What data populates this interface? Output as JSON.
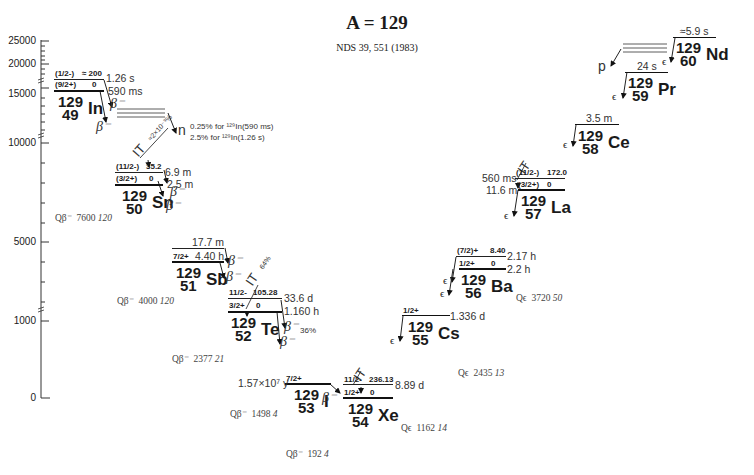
{
  "title": "A = 129",
  "reference": "NDS 39,  551  (1983)",
  "axis": {
    "ticks": [
      "25000",
      "20000",
      "15000",
      "10000",
      "5000",
      "1000",
      "0"
    ]
  },
  "nuclides": {
    "In": {
      "A": "129",
      "Z": "49",
      "sym": "In",
      "levels": [
        {
          "jp": "(1/2-)",
          "energy": "≈ 200",
          "halflife": "1.26 s"
        },
        {
          "jp": "(9/2+)",
          "energy": "0",
          "halflife": "590 ms"
        }
      ],
      "decays": [
        "β⁻",
        "β⁻"
      ]
    },
    "Sn": {
      "A": "129",
      "Z": "50",
      "sym": "Sn",
      "levels": [
        {
          "jp": "(11/2-)",
          "energy": "35.2",
          "halflife": "6.9 m"
        },
        {
          "jp": "(3/2+)",
          "energy": "0",
          "halflife": "2.5 m"
        }
      ],
      "decays": [
        "β⁻",
        "β⁻"
      ]
    },
    "Sb": {
      "A": "129",
      "Z": "51",
      "sym": "Sb",
      "levels": [
        {
          "jp": "",
          "energy": "",
          "halflife": "17.7 m"
        },
        {
          "jp": "7/2+",
          "energy": "",
          "halflife": "4.40 h"
        }
      ],
      "decays": [
        "β⁻",
        "β⁻"
      ]
    },
    "Te": {
      "A": "129",
      "Z": "52",
      "sym": "Te",
      "levels": [
        {
          "jp": "11/2-",
          "energy": "105.28",
          "halflife": "33.6 d"
        },
        {
          "jp": "3/2+",
          "energy": "0",
          "halflife": "1.160 h"
        }
      ],
      "decays": [
        "β⁻",
        "β⁻"
      ],
      "branch": "36%"
    },
    "I": {
      "A": "129",
      "Z": "53",
      "sym": "I",
      "levels": [
        {
          "jp": "7/2+",
          "energy": "",
          "halflife": "1.57×10⁷ y"
        }
      ],
      "decays": [
        "β⁻"
      ]
    },
    "Xe": {
      "A": "129",
      "Z": "54",
      "sym": "Xe",
      "levels": [
        {
          "jp": "11/2-",
          "energy": "236.13",
          "halflife": "8.89 d"
        },
        {
          "jp": "1/2+",
          "energy": "0",
          "halflife": ""
        }
      ]
    },
    "Cs": {
      "A": "129",
      "Z": "55",
      "sym": "Cs",
      "levels": [
        {
          "jp": "1/2+",
          "energy": "",
          "halflife": "1.336 d"
        }
      ],
      "decays": [
        "ϵ"
      ]
    },
    "Ba": {
      "A": "129",
      "Z": "56",
      "sym": "Ba",
      "levels": [
        {
          "jp": "(7/2)+",
          "energy": "8.40",
          "halflife": "2.17 h"
        },
        {
          "jp": "1/2+",
          "energy": "0",
          "halflife": "2.2 h"
        }
      ],
      "decays": [
        "ϵ",
        "ϵ"
      ]
    },
    "La": {
      "A": "129",
      "Z": "57",
      "sym": "La",
      "levels": [
        {
          "jp": "(11/2-)",
          "energy": "172.0",
          "halflife": "560 ms"
        },
        {
          "jp": "(3/2+)",
          "energy": "0",
          "halflife": "11.6 m"
        }
      ],
      "decays": [
        "ϵ"
      ]
    },
    "Ce": {
      "A": "129",
      "Z": "58",
      "sym": "Ce",
      "levels": [
        {
          "jp": "",
          "energy": "",
          "halflife": "3.5 m"
        }
      ],
      "decays": [
        "ϵ"
      ]
    },
    "Pr": {
      "A": "129",
      "Z": "59",
      "sym": "Pr",
      "levels": [
        {
          "jp": "",
          "energy": "",
          "halflife": "24 s"
        }
      ],
      "decays": [
        "ϵ"
      ]
    },
    "Nd": {
      "A": "129",
      "Z": "60",
      "sym": "Nd",
      "levels": [
        {
          "jp": "",
          "energy": "",
          "halflife": "≈5.9 s"
        }
      ],
      "decays": [
        "ϵ"
      ]
    }
  },
  "transitions": {
    "in_n": "n",
    "in_n_note1": "0.25% for ¹²⁹In(590 ms)",
    "in_n_note2": "2.5% for ¹²⁹In(1.26 s)",
    "sn_it": "IT",
    "sn_it_ratio": "≈2×10⁻³%",
    "sb_te_it": "IT",
    "te_it_pct": "64%",
    "xe_it": "IT",
    "la_it": "IT",
    "nd_p": "p"
  },
  "q_values": [
    {
      "label": "Qβ⁻",
      "value": "7600",
      "unc": "120"
    },
    {
      "label": "Qβ⁻",
      "value": "4000",
      "unc": "120"
    },
    {
      "label": "Qβ⁻",
      "value": "2377",
      "unc": "21"
    },
    {
      "label": "Qβ⁻",
      "value": "1498",
      "unc": "4"
    },
    {
      "label": "Qβ⁻",
      "value": "192",
      "unc": "4"
    },
    {
      "label": "Qϵ",
      "value": "1162",
      "unc": "14"
    },
    {
      "label": "Qϵ",
      "value": "2435",
      "unc": "13"
    },
    {
      "label": "Qϵ",
      "value": "3720",
      "unc": "50"
    }
  ]
}
